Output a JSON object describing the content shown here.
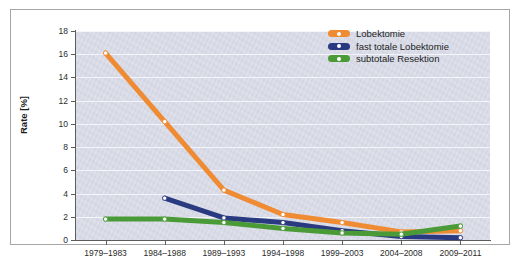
{
  "chart_data": {
    "type": "line",
    "title": "",
    "xlabel": "",
    "ylabel": "Rate [%]",
    "ylim": [
      0,
      18
    ],
    "ytick_step": 2,
    "grid": true,
    "legend_position": "top-right",
    "categories": [
      "1979–1983",
      "1984–1988",
      "1989–1993",
      "1994–1998",
      "1999–2003",
      "2004–2008",
      "2009–2011"
    ],
    "yticks": [
      "0",
      "2",
      "4",
      "6",
      "8",
      "10",
      "12",
      "14",
      "16",
      "18"
    ],
    "series": [
      {
        "name": "Lobektomie",
        "color": "#ef8b33",
        "values": [
          16.1,
          10.2,
          4.3,
          2.2,
          1.5,
          0.7,
          0.8
        ]
      },
      {
        "name": "fast totale Lobektomie",
        "color": "#2a3a80",
        "values": [
          null,
          3.6,
          1.9,
          1.5,
          0.8,
          0.3,
          0.2
        ]
      },
      {
        "name": "subtotale Resektion",
        "color": "#4a9b38",
        "values": [
          1.8,
          1.8,
          1.5,
          1.0,
          0.6,
          0.5,
          1.2
        ]
      }
    ]
  },
  "legend": {
    "items": [
      {
        "label": "Lobektomie"
      },
      {
        "label": "fast totale Lobektomie"
      },
      {
        "label": "subtotale Resektion"
      }
    ]
  },
  "colors": {
    "plot_background": "#d9dce8",
    "gridline": "#f4f5fa",
    "axis": "#5c5c5c",
    "panel_border": "#a6a6a6",
    "page_background": "#ffffff",
    "marker_fill": "#ffffff"
  }
}
